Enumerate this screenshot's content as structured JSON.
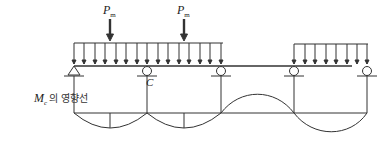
{
  "diagram": {
    "type": "influence-line-diagram",
    "loads": {
      "point_load_1": {
        "symbol": "P",
        "subscript": "m"
      },
      "point_load_2": {
        "symbol": "P",
        "subscript": "m"
      },
      "distributed_load_span_1": "uniform",
      "distributed_load_span_3": "uniform"
    },
    "support_label_c": "C",
    "influence_line_label": {
      "symbol": "M",
      "subscript": "c",
      "text": "의 영향선"
    },
    "colors": {
      "line": "#333333",
      "background": "#ffffff"
    }
  }
}
